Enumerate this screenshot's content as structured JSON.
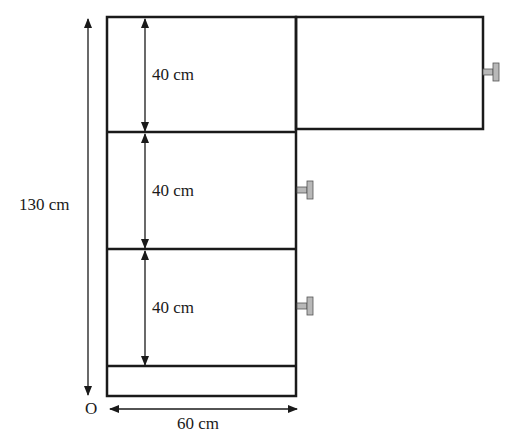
{
  "diagram": {
    "shelves": [
      {
        "label": "40 cm"
      },
      {
        "label": "40 cm"
      },
      {
        "label": "40 cm"
      }
    ],
    "total_height_label": "130 cm",
    "width_label": "60 cm",
    "origin_label": "O",
    "colors": {
      "line": "#1a1a1a",
      "handle_fill": "#b8b8b8",
      "background": "#ffffff"
    }
  }
}
